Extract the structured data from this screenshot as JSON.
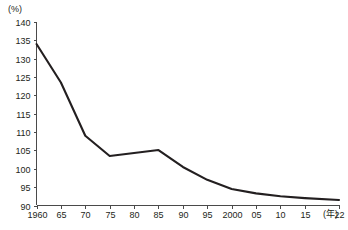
{
  "chart_data": {
    "type": "line",
    "title": "",
    "subtitle": "",
    "xlabel": "(年)",
    "ylabel": "(%)",
    "x_unit_label": "(年)",
    "y_unit_label": "(%)",
    "grid": false,
    "legend_position": "none",
    "xlim": [
      1960,
      2022
    ],
    "ylim": [
      90,
      140
    ],
    "y_ticks": [
      90,
      95,
      100,
      105,
      110,
      115,
      120,
      125,
      130,
      135,
      140
    ],
    "y_tick_labels": [
      "90",
      "95",
      "100",
      "105",
      "110",
      "115",
      "120",
      "125",
      "130",
      "135",
      "140"
    ],
    "x_ticks": [
      1960,
      1965,
      1970,
      1975,
      1980,
      1985,
      1990,
      1995,
      2000,
      2005,
      2010,
      2015,
      2022
    ],
    "x_tick_labels": [
      "1960",
      "65",
      "70",
      "75",
      "80",
      "85",
      "90",
      "95",
      "2000",
      "05",
      "10",
      "15",
      "22"
    ],
    "series": [
      {
        "name": "",
        "color": "#231f20",
        "x": [
          1960,
          1965,
          1970,
          1975,
          1980,
          1985,
          1990,
          1995,
          2000,
          2005,
          2010,
          2015,
          2022
        ],
        "values": [
          134.0,
          123.5,
          109.0,
          103.5,
          104.3,
          105.1,
          100.5,
          97.0,
          94.5,
          93.3,
          92.5,
          92.0,
          91.5
        ]
      }
    ],
    "annotations": []
  },
  "source_note": ""
}
